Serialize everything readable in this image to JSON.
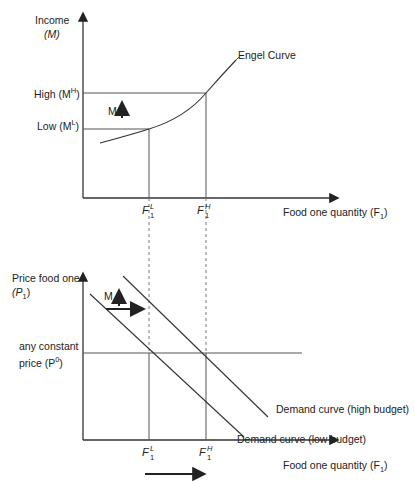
{
  "top_chart": {
    "y_axis_label_line1": "Income",
    "y_axis_label_line2": "(M)",
    "x_axis_label": "Food one quantity (F",
    "x_axis_label_sub": "1",
    "x_axis_label_end": ")",
    "high_label": "High (M",
    "high_sup": "H",
    "low_label": "Low (M",
    "low_sup": "L",
    "close_paren": ")",
    "shift_label": "M",
    "curve_label": "Engel Curve",
    "tick_low": {
      "base": "F",
      "sup": "L",
      "sub": "1"
    },
    "tick_high": {
      "base": "F",
      "sup": "H",
      "sub": "1"
    }
  },
  "bottom_chart": {
    "y_axis_label_line1": "Price food one",
    "y_axis_label_line2": "(P",
    "y_axis_label_sub": "1",
    "y_axis_label_end": ")",
    "price_label_line1": "any constant",
    "price_label_line2": "price (P",
    "price_sup": "0",
    "price_sub": "1",
    "shift_label": "M",
    "demand_high_label": "Demand curve (high budget)",
    "demand_low_label": "Demand curve (low budget)",
    "x_axis_label": "Food one quantity (F",
    "x_axis_label_sub": "1",
    "x_axis_label_end": ")",
    "tick_low": {
      "base": "F",
      "sup": "L",
      "sub": "1"
    },
    "tick_high": {
      "base": "F",
      "sup": "H",
      "sub": "1"
    }
  },
  "colors": {
    "line": "#333333",
    "text": "#222222",
    "guide": "#777777"
  }
}
